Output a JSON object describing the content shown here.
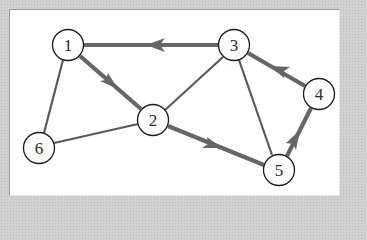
{
  "diagram": {
    "type": "directed-graph",
    "nodes": [
      {
        "id": "1",
        "label": "1",
        "x": 68,
        "y": 45
      },
      {
        "id": "2",
        "label": "2",
        "x": 153,
        "y": 120
      },
      {
        "id": "3",
        "label": "3",
        "x": 234,
        "y": 45
      },
      {
        "id": "4",
        "label": "4",
        "x": 319,
        "y": 94
      },
      {
        "id": "5",
        "label": "5",
        "x": 279,
        "y": 170
      },
      {
        "id": "6",
        "label": "6",
        "x": 39,
        "y": 148
      }
    ],
    "edges": [
      {
        "from": "3",
        "to": "1",
        "directed": true,
        "style": "thick"
      },
      {
        "from": "1",
        "to": "2",
        "directed": true,
        "style": "thick"
      },
      {
        "from": "2",
        "to": "5",
        "directed": true,
        "style": "thick"
      },
      {
        "from": "5",
        "to": "4",
        "directed": true,
        "style": "thick"
      },
      {
        "from": "4",
        "to": "3",
        "directed": true,
        "style": "thick"
      },
      {
        "from": "1",
        "to": "6",
        "directed": false,
        "style": "thin"
      },
      {
        "from": "6",
        "to": "2",
        "directed": false,
        "style": "thin"
      },
      {
        "from": "2",
        "to": "3",
        "directed": false,
        "style": "thin"
      },
      {
        "from": "3",
        "to": "5",
        "directed": false,
        "style": "thin"
      }
    ],
    "colors": {
      "edge_thick": "#666666",
      "edge_thin": "#5a5a5a",
      "node_stroke": "#1a1a1a",
      "panel_bg": "#ffffff",
      "page_bg": "#cfcfcf"
    }
  }
}
